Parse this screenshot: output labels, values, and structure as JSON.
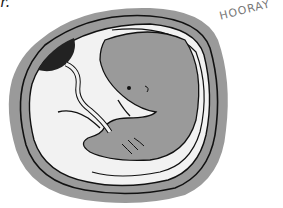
{
  "illustration": {
    "subject": "embryo in amniotic sac",
    "corner_text": "r.",
    "caption": "HOORAY",
    "colors": {
      "outer_sac": "#9a9a9a",
      "inner_fluid": "#f2f2f2",
      "embryo": "#9a9a9a",
      "dark_spot": "#222222",
      "outline": "#111111",
      "caption": "#777777"
    }
  }
}
